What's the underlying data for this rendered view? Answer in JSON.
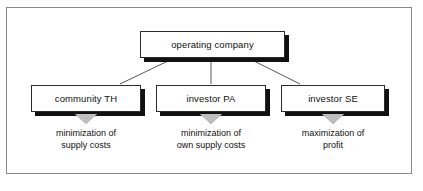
{
  "diagram": {
    "colors": {
      "frame_border": "#8a8a8a",
      "node_border": "#2b2b2b",
      "node_shadow": "#111111",
      "node_fill": "#ffffff",
      "arrow_fill": "#bfbfbf",
      "connector": "#444444",
      "text": "#111111"
    },
    "root": {
      "label": "operating company"
    },
    "children": [
      {
        "label": "community TH",
        "arrow": "down-triangle",
        "objective_line_1": "minimization of",
        "objective_line_2": "supply costs"
      },
      {
        "label": "investor PA",
        "arrow": "down-triangle",
        "objective_line_1": "minimization of",
        "objective_line_2": "own supply costs"
      },
      {
        "label": "investor SE",
        "arrow": "down-triangle",
        "objective_line_1": "maximization of",
        "objective_line_2": "profit"
      }
    ]
  }
}
